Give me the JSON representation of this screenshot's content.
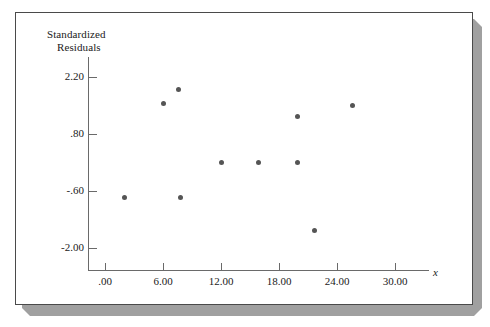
{
  "figure": {
    "frame_border_color": "#4a4a4a",
    "shadow_color": "#a0a0a0",
    "background_color": "#ffffff",
    "axis_color": "#6a6a6a",
    "marker_color": "#555555"
  },
  "labels": {
    "y_axis_title_line1": "Standardized",
    "y_axis_title_line2": "Residuals",
    "x_axis_variable": "x"
  },
  "chart_data": {
    "type": "scatter",
    "title": "",
    "xlabel": "x",
    "ylabel": "Standardized Residuals",
    "xlim": [
      -2.0,
      34.0
    ],
    "ylim": [
      -2.85,
      2.95
    ],
    "grid": false,
    "legend": null,
    "xticks": [
      0,
      6,
      12,
      18,
      24,
      30
    ],
    "xticklabels": [
      ".00",
      "6.00",
      "12.00",
      "18.00",
      "24.00",
      "30.00"
    ],
    "yticks": [
      2.2,
      0.8,
      -0.6,
      -2.0
    ],
    "yticklabels": [
      "2.20",
      ".80",
      "-.60",
      "-2.00"
    ],
    "points": [
      {
        "x": 2.0,
        "y": -0.75
      },
      {
        "x": 6.0,
        "y": 1.54
      },
      {
        "x": 7.6,
        "y": 1.9
      },
      {
        "x": 7.8,
        "y": -0.75
      },
      {
        "x": 12.0,
        "y": 0.11
      },
      {
        "x": 15.9,
        "y": 0.11
      },
      {
        "x": 19.9,
        "y": 1.24
      },
      {
        "x": 19.9,
        "y": 0.11
      },
      {
        "x": 21.7,
        "y": -1.57
      },
      {
        "x": 25.6,
        "y": 1.49
      }
    ]
  }
}
